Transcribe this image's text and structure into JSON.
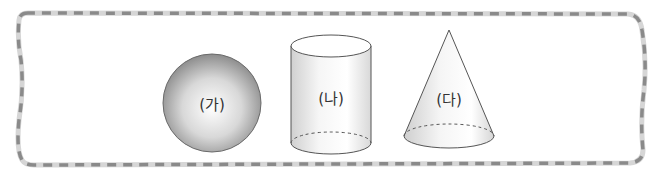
{
  "figure": {
    "border_colors": {
      "dash": "#8a8a8a",
      "track": "#d6d6d6"
    },
    "shapes": [
      {
        "id": "sphere",
        "label": "(가)",
        "type": "sphere"
      },
      {
        "id": "cylinder",
        "label": "(나)",
        "type": "cylinder"
      },
      {
        "id": "cone",
        "label": "(다)",
        "type": "cone"
      }
    ]
  }
}
